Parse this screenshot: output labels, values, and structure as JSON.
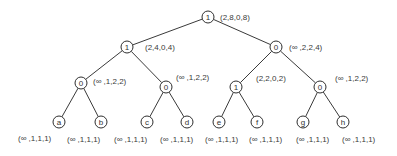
{
  "diagram": {
    "type": "binary-tree",
    "nodes": [
      {
        "id": "n0",
        "label": "1",
        "annotation": "(2,8,0,8)",
        "x": 208,
        "y": 17,
        "ax": 220,
        "ay": 17
      },
      {
        "id": "n1",
        "label": "1",
        "annotation": "(2,4,0,4)",
        "x": 127,
        "y": 47,
        "ax": 145,
        "ay": 47
      },
      {
        "id": "n2",
        "label": "0",
        "annotation": "(∞ ,2,2,4)",
        "x": 276,
        "y": 47,
        "ax": 289,
        "ay": 47
      },
      {
        "id": "n3",
        "label": "0",
        "annotation": "(∞ ,1,2,2)",
        "x": 81,
        "y": 83,
        "ax": 93,
        "ay": 81
      },
      {
        "id": "n4",
        "label": "0",
        "annotation": "(∞ ,1,2,2)",
        "x": 166,
        "y": 87,
        "ax": 176,
        "ay": 77
      },
      {
        "id": "n5",
        "label": "1",
        "annotation": "(2,2,0,2)",
        "x": 236,
        "y": 87,
        "ax": 256,
        "ay": 78
      },
      {
        "id": "n6",
        "label": "0",
        "annotation": "(∞ ,1,2,2)",
        "x": 320,
        "y": 87,
        "ax": 335,
        "ay": 78
      },
      {
        "id": "n7",
        "label": "a",
        "annotation": "(∞ ,1,1,1)",
        "x": 59,
        "y": 122,
        "ax": 18,
        "ay": 138
      },
      {
        "id": "n8",
        "label": "b",
        "annotation": "(∞ ,1,1,1)",
        "x": 101,
        "y": 122,
        "ax": 67,
        "ay": 139
      },
      {
        "id": "n9",
        "label": "c",
        "annotation": "(∞ ,1,1,1)",
        "x": 147,
        "y": 122,
        "ax": 114,
        "ay": 139
      },
      {
        "id": "n10",
        "label": "d",
        "annotation": "(∞ ,1,1,1)",
        "x": 187,
        "y": 122,
        "ax": 160,
        "ay": 139
      },
      {
        "id": "n11",
        "label": "e",
        "annotation": "(∞ ,1,1,1)",
        "x": 219,
        "y": 122,
        "ax": 205,
        "ay": 139
      },
      {
        "id": "n12",
        "label": "f",
        "annotation": "(∞ ,1,1,1)",
        "x": 257,
        "y": 122,
        "ax": 249,
        "ay": 139
      },
      {
        "id": "n13",
        "label": "g",
        "annotation": "(∞ ,1,1,1)",
        "x": 303,
        "y": 122,
        "ax": 296,
        "ay": 139
      },
      {
        "id": "n14",
        "label": "h",
        "annotation": "(∞ ,1,1,1)",
        "x": 343,
        "y": 122,
        "ax": 342,
        "ay": 139
      }
    ],
    "edges": [
      [
        "n0",
        "n1"
      ],
      [
        "n0",
        "n2"
      ],
      [
        "n1",
        "n3"
      ],
      [
        "n1",
        "n4"
      ],
      [
        "n2",
        "n5"
      ],
      [
        "n2",
        "n6"
      ],
      [
        "n3",
        "n7"
      ],
      [
        "n3",
        "n8"
      ],
      [
        "n4",
        "n9"
      ],
      [
        "n4",
        "n10"
      ],
      [
        "n5",
        "n11"
      ],
      [
        "n5",
        "n12"
      ],
      [
        "n6",
        "n13"
      ],
      [
        "n6",
        "n14"
      ]
    ],
    "node_radius": 6,
    "colors": {
      "stroke": "#2f2f2f",
      "text": "#333333",
      "background": "#ffffff"
    }
  }
}
